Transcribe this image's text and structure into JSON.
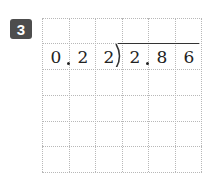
{
  "problem": {
    "number": "3",
    "divisor_digits": [
      "0",
      "2"
    ],
    "dividend_digits": [
      "2",
      "8",
      "6"
    ],
    "layout_cells": [
      "0",
      "2",
      "2",
      "2",
      "8",
      "6"
    ],
    "divisor_text": "0.22",
    "dividend_text": "2.86"
  },
  "grid": {
    "columns": 6,
    "rows": 6,
    "line_color": "#b8b8b8"
  },
  "badge_color": "#4d4d4d"
}
